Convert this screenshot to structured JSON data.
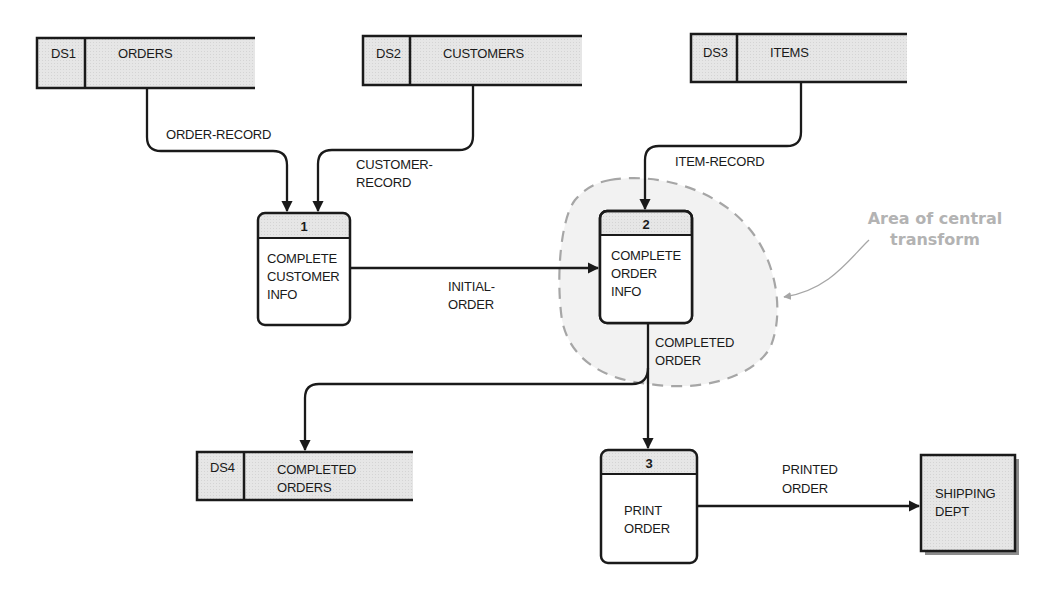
{
  "diagram": {
    "type": "data-flow-diagram",
    "colors": {
      "line": "#1a1a1a",
      "store_fill": "#e6e6e6",
      "process_header_fill": "#dcdcdc",
      "process_body_fill": "#ffffff",
      "entity_fill": "#e4e4e4",
      "central_area_fill": "#f2f2f2",
      "central_area_border": "#a6a6a6",
      "annotation_text": "#b3b3b3"
    },
    "data_stores": [
      {
        "id": "DS1",
        "name": "ORDERS"
      },
      {
        "id": "DS2",
        "name": "CUSTOMERS"
      },
      {
        "id": "DS3",
        "name": "ITEMS"
      },
      {
        "id": "DS4",
        "name_line1": "COMPLETED",
        "name_line2": "ORDERS"
      }
    ],
    "processes": [
      {
        "number": "1",
        "line1": "COMPLETE",
        "line2": "CUSTOMER",
        "line3": "INFO"
      },
      {
        "number": "2",
        "line1": "COMPLETE",
        "line2": "ORDER",
        "line3": "INFO"
      },
      {
        "number": "3",
        "line1": "PRINT",
        "line2": "ORDER"
      }
    ],
    "external_entity": {
      "line1": "SHIPPING",
      "line2": "DEPT"
    },
    "flows": {
      "order_record": "ORDER-RECORD",
      "customer_record_1": "CUSTOMER-",
      "customer_record_2": "RECORD",
      "item_record": "ITEM-RECORD",
      "initial_order_1": "INITIAL-",
      "initial_order_2": "ORDER",
      "completed_order_1": "COMPLETED",
      "completed_order_2": "ORDER",
      "printed_order_1": "PRINTED",
      "printed_order_2": "ORDER"
    },
    "annotation": {
      "line1": "Area of central",
      "line2": "transform"
    }
  }
}
